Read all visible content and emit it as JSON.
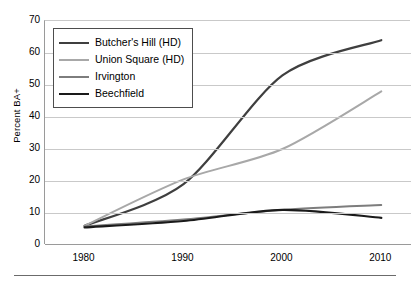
{
  "chart_data": {
    "type": "line",
    "title": "",
    "xlabel": "",
    "ylabel": "Percent BA+",
    "x": [
      1980,
      1990,
      2000,
      2010
    ],
    "xlim": [
      1976,
      2013
    ],
    "ylim": [
      0,
      70
    ],
    "ytick_labels": [
      "0",
      "10",
      "20",
      "30",
      "40",
      "50",
      "60",
      "70"
    ],
    "ytick_values": [
      0,
      10,
      20,
      30,
      40,
      50,
      60,
      70
    ],
    "xtick_labels": [
      "1980",
      "1990",
      "2000",
      "2010"
    ],
    "grid": "horizontal",
    "legend_position": "upper-left",
    "series": [
      {
        "name": "Butcher's Hill (HD)",
        "color": "#3f3f3f",
        "width": 2.2,
        "values": [
          6.0,
          19.0,
          53.0,
          64.0
        ]
      },
      {
        "name": "Union Square (HD)",
        "color": "#a8a8a8",
        "width": 2.0,
        "values": [
          6.0,
          20.5,
          30.0,
          48.0
        ]
      },
      {
        "name": "Irvington",
        "color": "#7d7d7d",
        "width": 1.8,
        "values": [
          5.8,
          8.0,
          11.0,
          12.5
        ]
      },
      {
        "name": "Beechfield",
        "color": "#1a1a1a",
        "width": 2.2,
        "values": [
          5.5,
          7.5,
          11.0,
          8.5
        ]
      }
    ]
  },
  "legend": {
    "items": [
      {
        "label": "Butcher's Hill (HD)"
      },
      {
        "label": "Union Square (HD)"
      },
      {
        "label": "Irvington"
      },
      {
        "label": "Beechfield"
      }
    ]
  }
}
